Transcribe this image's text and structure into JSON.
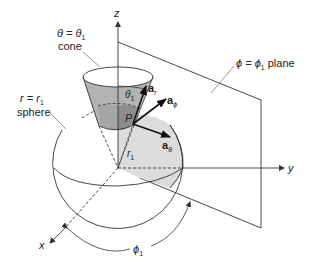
{
  "figure": {
    "colors": {
      "line": "#333333",
      "cone_fill": "#b3b3b3",
      "cone_dark": "#8c8c8c",
      "sphere_patch": "#dcdcdc",
      "arrow": "#111111"
    },
    "axes": {
      "z": "z",
      "y": "y",
      "x": "x"
    },
    "labels": {
      "cone_line1": "θ = θ",
      "cone_line1_sub": "1",
      "cone_line2": "cone",
      "sphere_line1": "r = r",
      "sphere_line1_sub": "1",
      "sphere_line2": "sphere",
      "plane_text": "ϕ = ϕ",
      "plane_sub": "1",
      "plane_word": " plane",
      "point": "P",
      "theta_angle": "θ",
      "theta_angle_sub": "1",
      "radius": "r",
      "radius_sub": "1",
      "phi_angle": "ϕ",
      "phi_angle_sub": "1"
    },
    "unit_vectors": {
      "a_r": {
        "base": "a",
        "sub": "r"
      },
      "a_phi": {
        "base": "a",
        "sub": "ϕ"
      },
      "a_theta": {
        "base": "a",
        "sub": "θ"
      }
    }
  }
}
